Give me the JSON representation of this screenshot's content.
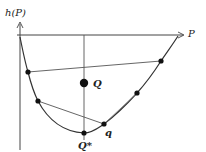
{
  "diagram": {
    "y_axis_label": "h(P)",
    "x_axis_label": "P",
    "points": {
      "Q": {
        "label": "Q",
        "x": 84,
        "y": 83,
        "r": 4.2
      },
      "Q_star": {
        "label": "Q*",
        "x": 84,
        "y": 133,
        "r": 2.6
      },
      "q": {
        "label": "q",
        "x": 104,
        "y": 124,
        "r": 2.6
      },
      "upper_left": {
        "x": 28,
        "y": 72,
        "r": 2.6
      },
      "upper_right": {
        "x": 161,
        "y": 61,
        "r": 2.6
      },
      "lower_left": {
        "x": 38,
        "y": 101,
        "r": 2.6
      },
      "lower_right": {
        "x": 137,
        "y": 93,
        "r": 2.6
      }
    },
    "colors": {
      "line": "#333333",
      "point": "#111111",
      "axis": "#444444"
    }
  }
}
